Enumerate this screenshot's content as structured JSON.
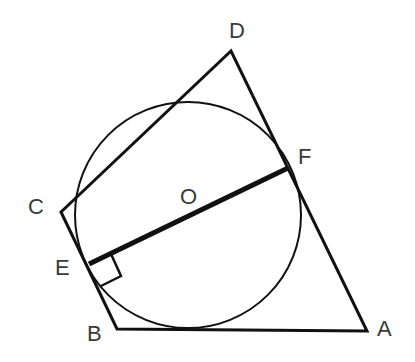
{
  "diagram": {
    "labels": {
      "A": "A",
      "B": "B",
      "C": "C",
      "D": "D",
      "E": "E",
      "F": "F",
      "O": "O"
    },
    "points": {
      "A": [
        367,
        331
      ],
      "B": [
        117,
        329
      ],
      "C": [
        61,
        212
      ],
      "D": [
        231,
        51
      ],
      "E": [
        89,
        264
      ],
      "F": [
        288,
        168
      ]
    },
    "circle": {
      "center": [
        188,
        215
      ],
      "radius": 113
    },
    "segments": [
      "A-B",
      "B-C",
      "C-D",
      "D-A",
      "E-F"
    ],
    "thick_segment": "E-F",
    "right_angle_at": "E",
    "stroke_color": "#111111",
    "label_color": "#3a3a3a"
  }
}
